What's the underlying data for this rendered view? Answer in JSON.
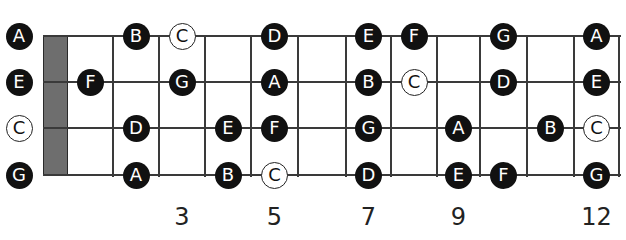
{
  "diagram": {
    "type": "fretboard",
    "instrument_tuning": [
      "A",
      "E",
      "C",
      "G"
    ],
    "colors": {
      "natural_note": "#111111",
      "c_note": "#ffffff",
      "nut": "#6e6e6e",
      "line": "#3a3a3a"
    },
    "fret_markers": [
      {
        "fret": 3,
        "label": "3"
      },
      {
        "fret": 5,
        "label": "5"
      },
      {
        "fret": 7,
        "label": "7"
      },
      {
        "fret": 9,
        "label": "9"
      },
      {
        "fret": 12,
        "label": "12"
      }
    ],
    "strings": [
      {
        "name": "A",
        "notes": [
          {
            "fret": 0,
            "note": "A",
            "style": "dark"
          },
          {
            "fret": 2,
            "note": "B",
            "style": "dark"
          },
          {
            "fret": 3,
            "note": "C",
            "style": "light"
          },
          {
            "fret": 5,
            "note": "D",
            "style": "dark"
          },
          {
            "fret": 7,
            "note": "E",
            "style": "dark"
          },
          {
            "fret": 8,
            "note": "F",
            "style": "dark"
          },
          {
            "fret": 10,
            "note": "G",
            "style": "dark"
          },
          {
            "fret": 12,
            "note": "A",
            "style": "dark"
          }
        ]
      },
      {
        "name": "E",
        "notes": [
          {
            "fret": 0,
            "note": "E",
            "style": "dark"
          },
          {
            "fret": 1,
            "note": "F",
            "style": "dark"
          },
          {
            "fret": 3,
            "note": "G",
            "style": "dark"
          },
          {
            "fret": 5,
            "note": "A",
            "style": "dark"
          },
          {
            "fret": 7,
            "note": "B",
            "style": "dark"
          },
          {
            "fret": 8,
            "note": "C",
            "style": "light"
          },
          {
            "fret": 10,
            "note": "D",
            "style": "dark"
          },
          {
            "fret": 12,
            "note": "E",
            "style": "dark"
          }
        ]
      },
      {
        "name": "C",
        "notes": [
          {
            "fret": 0,
            "note": "C",
            "style": "light"
          },
          {
            "fret": 2,
            "note": "D",
            "style": "dark"
          },
          {
            "fret": 4,
            "note": "E",
            "style": "dark"
          },
          {
            "fret": 5,
            "note": "F",
            "style": "dark"
          },
          {
            "fret": 7,
            "note": "G",
            "style": "dark"
          },
          {
            "fret": 9,
            "note": "A",
            "style": "dark"
          },
          {
            "fret": 11,
            "note": "B",
            "style": "dark"
          },
          {
            "fret": 12,
            "note": "C",
            "style": "light"
          }
        ]
      },
      {
        "name": "G",
        "notes": [
          {
            "fret": 0,
            "note": "G",
            "style": "dark"
          },
          {
            "fret": 2,
            "note": "A",
            "style": "dark"
          },
          {
            "fret": 4,
            "note": "B",
            "style": "dark"
          },
          {
            "fret": 5,
            "note": "C",
            "style": "light"
          },
          {
            "fret": 7,
            "note": "D",
            "style": "dark"
          },
          {
            "fret": 9,
            "note": "E",
            "style": "dark"
          },
          {
            "fret": 10,
            "note": "F",
            "style": "dark"
          },
          {
            "fret": 12,
            "note": "G",
            "style": "dark"
          }
        ]
      }
    ]
  }
}
